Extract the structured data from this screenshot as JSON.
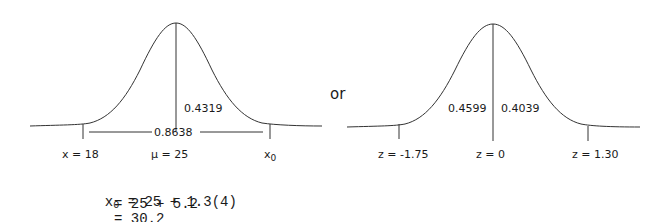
{
  "left_diagram": {
    "area_right": "0.4319",
    "area_between": "0.8638",
    "labels": {
      "x_left": "x = 18",
      "mu": "μ = 25",
      "x0_base": "x",
      "x0_sub": "0"
    }
  },
  "connector": "or",
  "right_diagram": {
    "area_left": "0.4599",
    "area_right": "0.4039",
    "labels": {
      "z_left": "z = -1.75",
      "z_center": "z = 0",
      "z_right": "z = 1.30"
    }
  },
  "calculation": {
    "lhs_base": "x",
    "lhs_sub": "0",
    "line1": " = 25 + 1.3(4)",
    "line2": "= 25 + 5.2",
    "line3": "= 30.2"
  }
}
